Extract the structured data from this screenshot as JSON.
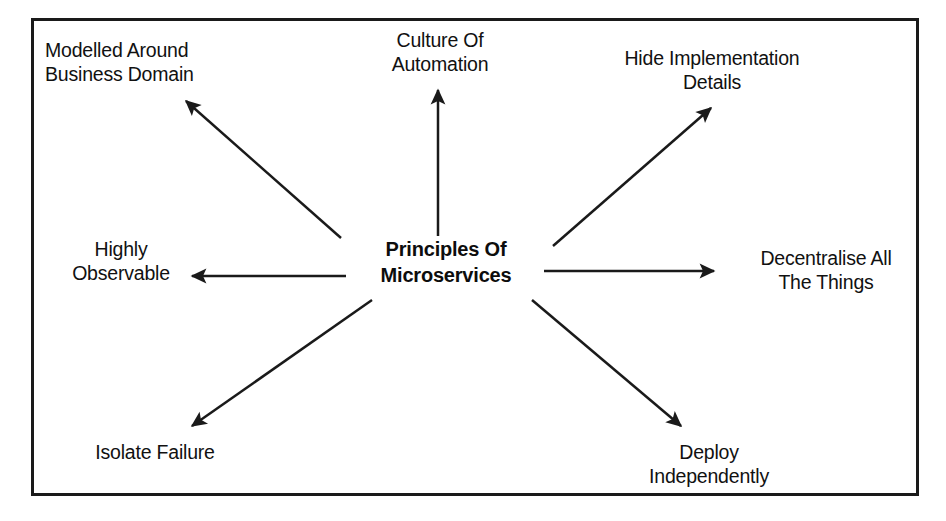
{
  "diagram": {
    "type": "radial-hub-and-spoke",
    "title": "Principles Of Microservices",
    "frame": {
      "border_color": "#1a1a1a",
      "background": "#ffffff"
    },
    "center": {
      "label": "Principles Of\nMicroservices",
      "line1": "Principles Of",
      "line2": "Microservices"
    },
    "nodes": [
      {
        "id": "modelled-around-business-domain",
        "label": "Modelled Around\nBusiness Domain",
        "align": "left",
        "direction": "up-left"
      },
      {
        "id": "culture-of-automation",
        "label": "Culture Of\nAutomation",
        "align": "centered",
        "direction": "up"
      },
      {
        "id": "hide-implementation-details",
        "label": "Hide Implementation\nDetails",
        "align": "centered",
        "direction": "up-right"
      },
      {
        "id": "decentralise-all-the-things",
        "label": "Decentralise All\nThe Things",
        "align": "centered",
        "direction": "right"
      },
      {
        "id": "deploy-independently",
        "label": "Deploy\nIndependently",
        "align": "centered",
        "direction": "down-right"
      },
      {
        "id": "isolate-failure",
        "label": "Isolate Failure",
        "align": "centered",
        "direction": "down-left"
      },
      {
        "id": "highly-observable",
        "label": "Highly\nObservable",
        "align": "centered",
        "direction": "left"
      }
    ],
    "arrows": [
      {
        "id": "arrow-to-modelled-around-business-domain",
        "from": [
          341,
          238
        ],
        "to": [
          186,
          101
        ]
      },
      {
        "id": "arrow-to-culture-of-automation",
        "from": [
          438,
          236
        ],
        "to": [
          438,
          90
        ]
      },
      {
        "id": "arrow-to-hide-implementation-details",
        "from": [
          553,
          246
        ],
        "to": [
          711,
          108
        ]
      },
      {
        "id": "arrow-to-decentralise-all-the-things",
        "from": [
          544,
          271
        ],
        "to": [
          714,
          271
        ]
      },
      {
        "id": "arrow-to-deploy-independently",
        "from": [
          532,
          300
        ],
        "to": [
          681,
          426
        ]
      },
      {
        "id": "arrow-to-isolate-failure",
        "from": [
          372,
          300
        ],
        "to": [
          192,
          426
        ]
      },
      {
        "id": "arrow-to-highly-observable",
        "from": [
          346,
          276
        ],
        "to": [
          192,
          276
        ]
      }
    ],
    "colors": {
      "stroke": "#1a1a1a",
      "text": "#111111",
      "background": "#ffffff"
    }
  }
}
